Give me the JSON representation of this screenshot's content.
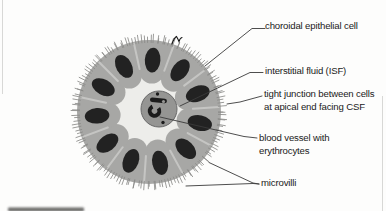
{
  "figure": {
    "labels": {
      "epithelial": "choroidal epithelial cell",
      "isf": "interstitial fluid (ISF)",
      "tight1": "tight junction between cells",
      "tight2": "at apical end facing CSF",
      "vessel1": "blood vessel with",
      "vessel2": "erythrocytes",
      "microvilli": "microvilli"
    },
    "colors": {
      "background": "#fdfdfc",
      "cell_body": "#a7a7a5",
      "cell_seam": "#cbcbc9",
      "microvilli": "#8a8a88",
      "nucleus": "#1c1c1c",
      "isf_lumen": "#ededea",
      "vessel_fill": "#959593",
      "vessel_rim": "#6a6a6a",
      "erythrocyte": "#1b1b1b",
      "leader_line": "#3a3a3a",
      "label_text": "#1a1a1a",
      "pen_mark": "#161616",
      "frame_line": "#d8d8d6",
      "bottom_bar": "#474745"
    },
    "cell_count": 11
  }
}
